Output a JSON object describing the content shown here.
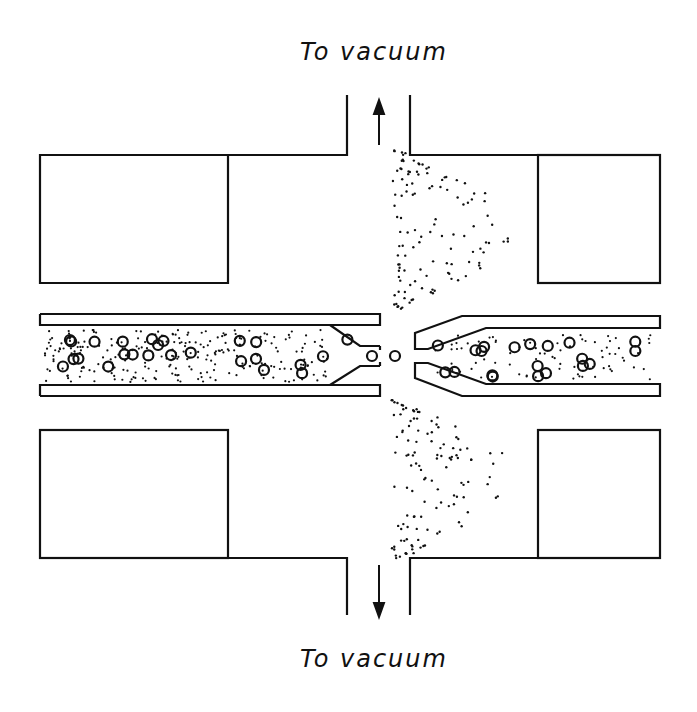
{
  "labels": {
    "top": "To vacuum",
    "bottom": "To vacuum"
  },
  "colors": {
    "ink": "#111111",
    "background": "#ffffff"
  },
  "components": {
    "left_capillary": "inlet capillary with liquid and particles",
    "right_capillary": "skimmer / outlet capillary",
    "pump_ports": [
      "top",
      "bottom"
    ],
    "blocks": [
      "top-left",
      "top-right",
      "bottom-left",
      "bottom-right"
    ]
  }
}
